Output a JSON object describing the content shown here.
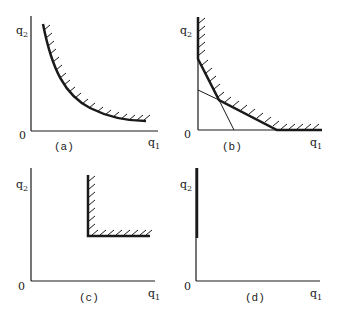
{
  "figure": {
    "panels": [
      {
        "id": "a",
        "caption": "(a)",
        "y_label": "q",
        "y_sub": "2",
        "x_label": "q",
        "x_sub": "1",
        "origin": "0",
        "description": "smooth convex isoquant with hatching above"
      },
      {
        "id": "b",
        "caption": "(b)",
        "y_label": "q",
        "y_sub": "2",
        "x_label": "q",
        "x_sub": "1",
        "origin": "0",
        "description": "piecewise linear isoquant with two linear segments"
      },
      {
        "id": "c",
        "caption": "(c)",
        "y_label": "q",
        "y_sub": "2",
        "x_label": "q",
        "x_sub": "1",
        "origin": "0",
        "description": "L-shaped (Leontief) isoquant"
      },
      {
        "id": "d",
        "caption": "(d)",
        "y_label": "q",
        "y_sub": "2",
        "x_label": "q",
        "x_sub": "1",
        "origin": "0",
        "description": "isoquant along vertical axis"
      }
    ],
    "colors": {
      "ink": "#1a1a1a",
      "background": "#ffffff"
    }
  }
}
